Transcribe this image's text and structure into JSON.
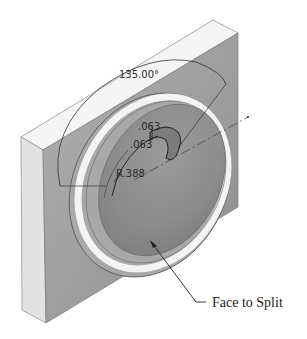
{
  "figure": {
    "dimensions": {
      "angle": "135.00°",
      "thickness_1": ".063",
      "thickness_2": ".063",
      "radius": "R.388"
    },
    "callout": {
      "label": "Face to Split"
    },
    "colors": {
      "top_face": "#f4f4f4",
      "left_face": "#dedede",
      "front_face": "#9c9c9c",
      "dish": "#8a8a8a",
      "rim_highlight": "#f8f8f8",
      "line": "#333333"
    }
  }
}
